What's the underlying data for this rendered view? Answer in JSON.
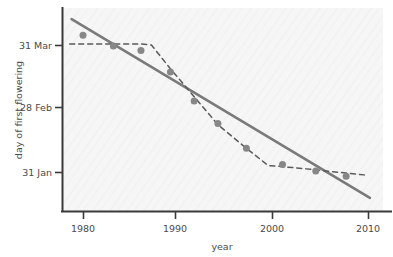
{
  "chart_data": {
    "type": "scatter",
    "title": "",
    "xlabel": "year",
    "ylabel": "day of first flowering",
    "xlim": [
      1978.0,
      2011.0
    ],
    "ylim_labels": [
      "31 Jan",
      "28 Feb",
      "31 Mar"
    ],
    "grid": false,
    "legend": "none",
    "x_ticks": [
      1980,
      1990,
      2000,
      2010
    ],
    "x_tick_labels": [
      "1980",
      "1990",
      "2000",
      "2010"
    ],
    "y_ticks": [
      31,
      59,
      90
    ],
    "y_tick_labels": [
      "31 Jan",
      "28 Feb",
      "31 Mar"
    ],
    "points": [
      {
        "x": 1980.0,
        "y": 94.5
      },
      {
        "x": 1983.2,
        "y": 89.5
      },
      {
        "x": 1986.1,
        "y": 87.5
      },
      {
        "x": 1989.2,
        "y": 77.5
      },
      {
        "x": 1991.7,
        "y": 64.0
      },
      {
        "x": 1994.2,
        "y": 53.5
      },
      {
        "x": 1997.2,
        "y": 42.0
      },
      {
        "x": 2001.0,
        "y": 34.5
      },
      {
        "x": 2004.5,
        "y": 31.5
      },
      {
        "x": 2007.7,
        "y": 29.0
      }
    ],
    "series": [
      {
        "name": "linear trend",
        "style": "solid",
        "color": "#7a7a7a",
        "x": [
          1978.8,
          2010.2
        ],
        "y": [
          102.0,
          19.0
        ]
      },
      {
        "name": "smoothed trend",
        "style": "dashed",
        "color": "#5a5a5a",
        "x": [
          1978.6,
          1980.5,
          1983.2,
          1986.0,
          1987.2,
          1989.2,
          1991.7,
          1994.2,
          1997.2,
          1999.5,
          2001.0,
          2004.5,
          2007.7,
          2010.0
        ],
        "y": [
          90.5,
          90.5,
          90.5,
          90.5,
          90.0,
          79.0,
          66.0,
          53.0,
          42.0,
          34.0,
          33.5,
          32.0,
          30.5,
          29.5
        ]
      }
    ],
    "marker": {
      "shape": "circle",
      "color": "#878787",
      "size": 7
    },
    "axis_color": "#3a3a3a",
    "plot_background": "#f6f6f6"
  },
  "axes": {
    "y_title": "day of first flowering",
    "x_title": "year",
    "y_tick_0": "31 Jan",
    "y_tick_1": "28 Feb",
    "y_tick_2": "31 Mar",
    "x_tick_0": "1980",
    "x_tick_1": "1990",
    "x_tick_2": "2000",
    "x_tick_3": "2010"
  }
}
